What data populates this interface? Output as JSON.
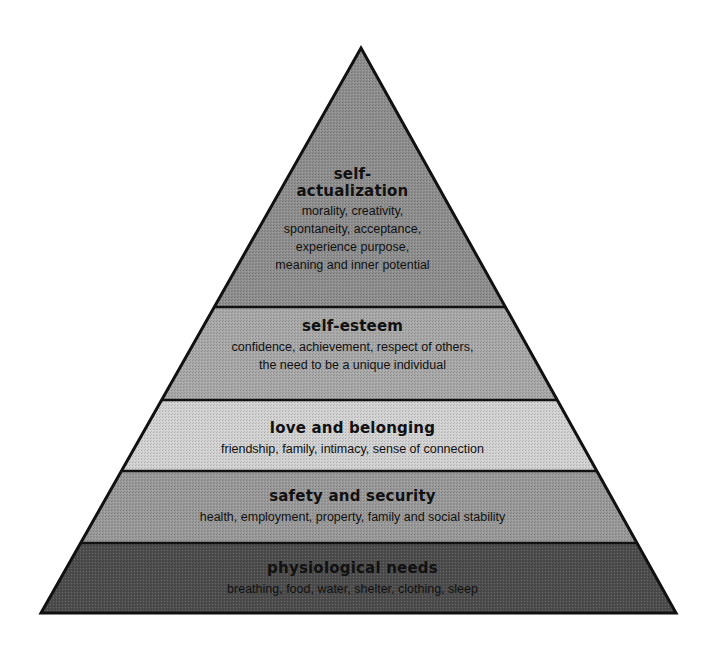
{
  "diagram": {
    "type": "pyramid",
    "geometry": {
      "apex": [
        361,
        48
      ],
      "base_left": [
        41,
        613
      ],
      "base_right": [
        676,
        613
      ],
      "band_boundaries_y": [
        307,
        400,
        471,
        543
      ]
    },
    "levels": [
      {
        "id": "self-actualization",
        "title_lines": [
          "self-",
          "actualization"
        ],
        "desc_lines": [
          "morality, creativity,",
          "spontaneity, acceptance,",
          "experience purpose,",
          "meaning and inner potential"
        ],
        "fill": "#8f8f8f"
      },
      {
        "id": "self-esteem",
        "title_lines": [
          "self-esteem"
        ],
        "desc_lines": [
          "confidence, achievement, respect of others,",
          "the need to be a unique individual"
        ],
        "fill": "#a9a9a9"
      },
      {
        "id": "love-and-belonging",
        "title_lines": [
          "love and belonging"
        ],
        "desc_lines": [
          "friendship, family, intimacy, sense of connection"
        ],
        "fill": "#d3d3d3"
      },
      {
        "id": "safety-and-security",
        "title_lines": [
          "safety and security"
        ],
        "desc_lines": [
          "health, employment, property, family and social stability"
        ],
        "fill": "#9a9a9a"
      },
      {
        "id": "physiological-needs",
        "title_lines": [
          "physiological needs"
        ],
        "desc_lines": [
          "breathing, food, water, shelter, clothing, sleep"
        ],
        "fill": "#4d4d4d"
      }
    ],
    "colors": {
      "outline": "#111111",
      "text": "#111111",
      "background": "#ffffff"
    }
  }
}
